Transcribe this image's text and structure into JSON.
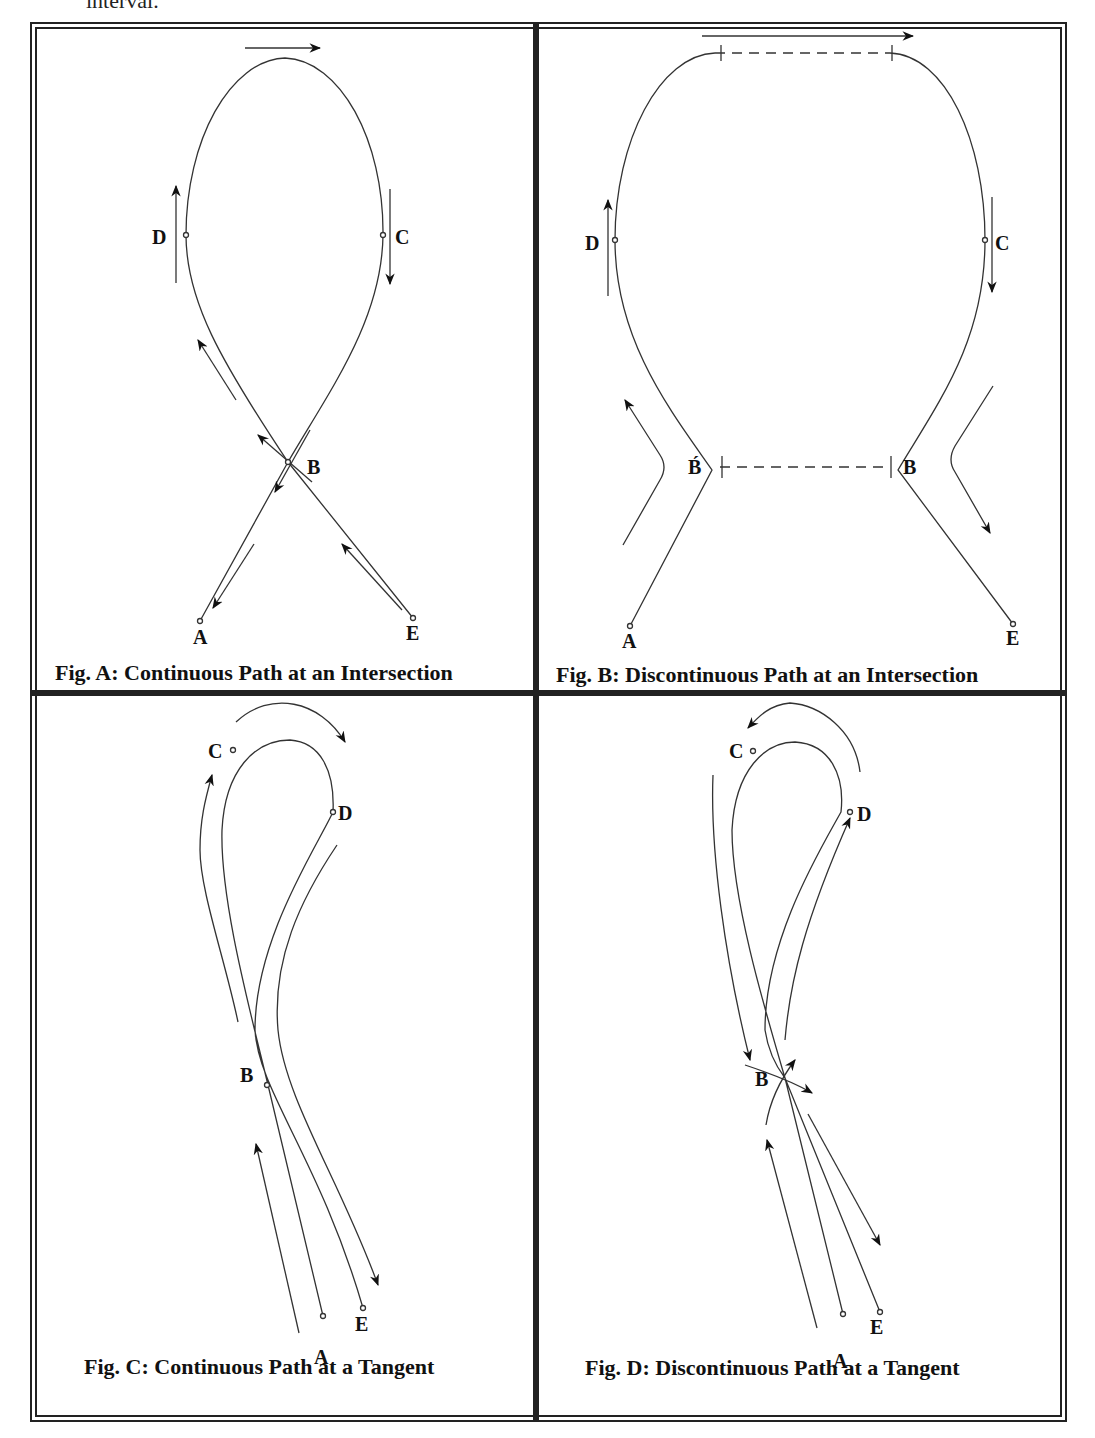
{
  "header": {
    "text": "interval."
  },
  "figures": [
    {
      "id": "A",
      "caption": "Fig. A: Continuous Path at an Intersection",
      "labels": {
        "A": "A",
        "B": "B",
        "C": "C",
        "D": "D",
        "E": "E"
      }
    },
    {
      "id": "B",
      "caption": "Fig. B: Discontinuous Path at an Intersection",
      "labels": {
        "A": "A",
        "B": "B",
        "B_prime": "B́",
        "C": "C",
        "D": "D",
        "E": "E"
      }
    },
    {
      "id": "C",
      "caption": "Fig. C: Continuous Path at a Tangent",
      "labels": {
        "A": "A",
        "B": "B",
        "C": "C",
        "D": "D",
        "E": "E"
      }
    },
    {
      "id": "D",
      "caption": "Fig. D: Discontinuous Path at a Tangent",
      "labels": {
        "A": "A",
        "B": "B",
        "C": "C",
        "D": "D",
        "E": "E"
      }
    }
  ]
}
